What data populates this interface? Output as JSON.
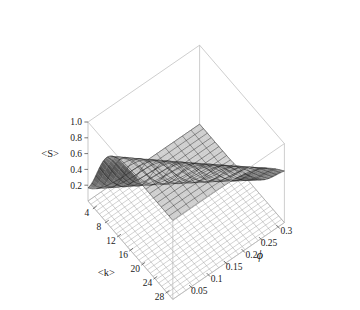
{
  "figure": {
    "type": "surface3d",
    "background": "#ffffff",
    "colorscheme": "grayscale"
  },
  "axes": {
    "z": {
      "label": "<S>",
      "ticks": [
        "1.0",
        "0.8",
        "0.6",
        "0.4",
        "0.2"
      ],
      "values": [
        1.0,
        0.8,
        0.6,
        0.4,
        0.2
      ],
      "range": [
        0.0,
        1.0
      ]
    },
    "x": {
      "label": "<k>",
      "ticks": [
        "4",
        "8",
        "12",
        "16",
        "20",
        "24",
        "28"
      ],
      "values": [
        4,
        8,
        12,
        16,
        20,
        24,
        28
      ],
      "range": [
        2,
        30
      ]
    },
    "y": {
      "label": "ϕ",
      "ticks": [
        "0.05",
        "0.1",
        "0.15",
        "0.2",
        "0.25",
        "0.3"
      ],
      "values": [
        0.05,
        0.1,
        0.15,
        0.2,
        0.25,
        0.3
      ],
      "range": [
        0.0,
        0.32
      ]
    }
  },
  "chart_data": {
    "type": "surface",
    "title": "",
    "xlabel": "<k>",
    "ylabel": "ϕ",
    "zlabel": "<S>",
    "xlim": [
      2,
      30
    ],
    "ylim": [
      0.0,
      0.32
    ],
    "zlim": [
      0.0,
      1.0
    ],
    "grid": true,
    "legend": "none",
    "x": [
      2,
      4,
      6,
      8,
      10,
      12,
      14,
      16,
      18,
      20,
      22,
      24,
      26,
      28,
      30
    ],
    "y": [
      0.0,
      0.05,
      0.1,
      0.15,
      0.2,
      0.25,
      0.3
    ],
    "series": [
      {
        "name": "ϕ = 0.00",
        "phi": 0.0,
        "threshold": 5.0,
        "values": [
          0.02,
          0.18,
          0.72,
          0.92,
          0.97,
          0.99,
          1.0,
          1.0,
          1.0,
          1.0,
          1.0,
          1.0,
          1.0,
          1.0,
          1.0
        ]
      },
      {
        "name": "ϕ = 0.05",
        "phi": 0.05,
        "threshold": 7.0,
        "values": [
          0.01,
          0.06,
          0.35,
          0.78,
          0.93,
          0.97,
          0.99,
          1.0,
          1.0,
          1.0,
          1.0,
          1.0,
          1.0,
          1.0,
          1.0
        ]
      },
      {
        "name": "ϕ = 0.10",
        "phi": 0.1,
        "threshold": 10.0,
        "values": [
          0.01,
          0.03,
          0.12,
          0.38,
          0.72,
          0.9,
          0.96,
          0.98,
          0.99,
          1.0,
          1.0,
          1.0,
          1.0,
          1.0,
          1.0
        ]
      },
      {
        "name": "ϕ = 0.15",
        "phi": 0.15,
        "threshold": 14.0,
        "values": [
          0.0,
          0.02,
          0.05,
          0.14,
          0.33,
          0.6,
          0.82,
          0.93,
          0.97,
          0.99,
          1.0,
          1.0,
          1.0,
          1.0,
          1.0
        ]
      },
      {
        "name": "ϕ = 0.20",
        "phi": 0.2,
        "threshold": 18.0,
        "values": [
          0.0,
          0.01,
          0.03,
          0.07,
          0.15,
          0.31,
          0.54,
          0.75,
          0.89,
          0.95,
          0.98,
          0.99,
          1.0,
          1.0,
          1.0
        ]
      },
      {
        "name": "ϕ = 0.25",
        "phi": 0.25,
        "threshold": 22.0,
        "values": [
          0.0,
          0.01,
          0.02,
          0.04,
          0.08,
          0.16,
          0.3,
          0.5,
          0.7,
          0.85,
          0.93,
          0.97,
          0.99,
          1.0,
          1.0
        ]
      },
      {
        "name": "ϕ = 0.30",
        "phi": 0.3,
        "threshold": 26.0,
        "values": [
          0.0,
          0.0,
          0.01,
          0.02,
          0.05,
          0.09,
          0.18,
          0.32,
          0.5,
          0.68,
          0.83,
          0.92,
          0.97,
          0.99,
          1.0
        ]
      }
    ]
  }
}
